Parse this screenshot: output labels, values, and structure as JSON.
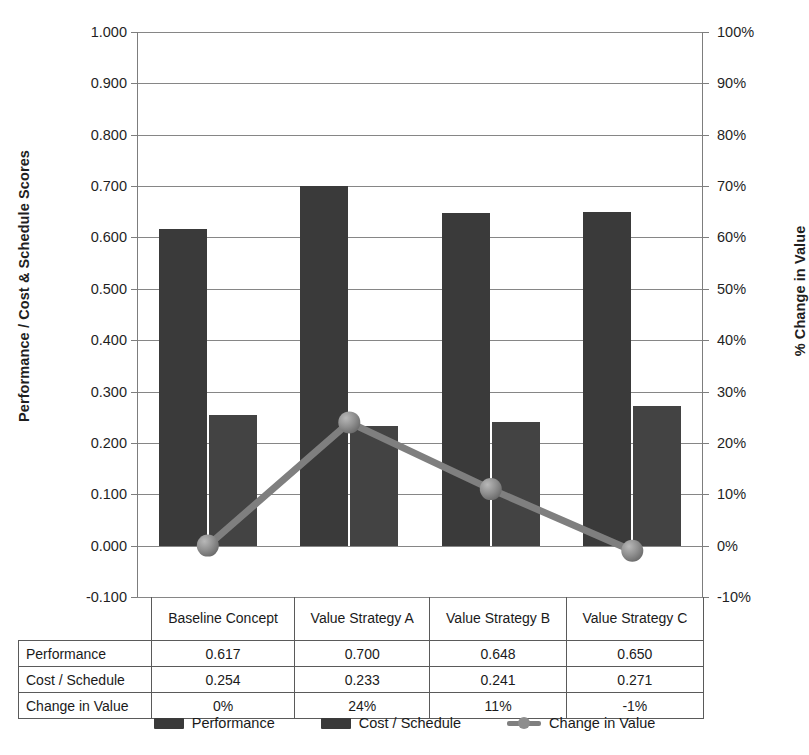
{
  "chart_data": {
    "type": "bar",
    "title": "",
    "categories": [
      "Baseline Concept",
      "Value Strategy A",
      "Value Strategy B",
      "Value Strategy C"
    ],
    "series": [
      {
        "name": "Performance",
        "axis": "left",
        "type": "bar",
        "values": [
          0.617,
          0.7,
          0.648,
          0.65
        ]
      },
      {
        "name": "Cost / Schedule",
        "axis": "left",
        "type": "bar",
        "values": [
          0.254,
          0.233,
          0.241,
          0.271
        ]
      },
      {
        "name": "Change in Value",
        "axis": "right",
        "type": "line",
        "values": [
          0,
          24,
          11,
          -1
        ]
      }
    ],
    "xlabel": "",
    "ylabel": "Performance / Cost & Schedule Scores",
    "y2label": "% Change in Value",
    "ylim": [
      -0.1,
      1.0
    ],
    "y2lim": [
      -10,
      100
    ],
    "grid": true,
    "legend_position": "bottom",
    "colors": {
      "performance": "#3a3a3a",
      "cost_schedule": "#434343",
      "change_in_value": "#7f7f7f",
      "gridline": "#868686"
    }
  },
  "axes": {
    "left": {
      "title": "Performance / Cost & Schedule Scores",
      "ticks": [
        "1.000",
        "0.900",
        "0.800",
        "0.700",
        "0.600",
        "0.500",
        "0.400",
        "0.300",
        "0.200",
        "0.100",
        "0.000",
        "-0.100"
      ]
    },
    "right": {
      "title": "% Change in Value",
      "ticks": [
        "100%",
        "90%",
        "80%",
        "70%",
        "60%",
        "50%",
        "40%",
        "30%",
        "20%",
        "10%",
        "0%",
        "-10%"
      ]
    }
  },
  "table": {
    "columns": [
      "Baseline Concept",
      "Value Strategy A",
      "Value Strategy B",
      "Value Strategy C"
    ],
    "rows": [
      {
        "label": "Performance",
        "values": [
          "0.617",
          "0.700",
          "0.648",
          "0.650"
        ]
      },
      {
        "label": "Cost / Schedule",
        "values": [
          "0.254",
          "0.233",
          "0.241",
          "0.271"
        ]
      },
      {
        "label": "Change in Value",
        "values": [
          "0%",
          "24%",
          "11%",
          "-1%"
        ]
      }
    ]
  },
  "legend": {
    "items": [
      {
        "label": "Performance",
        "marker": "bar-swatch"
      },
      {
        "label": "Cost / Schedule",
        "marker": "bar-swatch"
      },
      {
        "label": "Change in Value",
        "marker": "line-marker-swatch"
      }
    ]
  }
}
